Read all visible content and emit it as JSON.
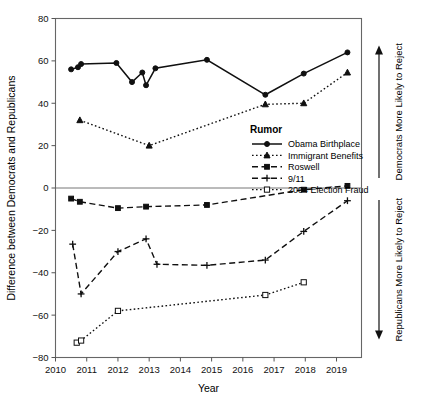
{
  "chart_data": {
    "type": "line",
    "title": "",
    "xlabel": "Year",
    "ylabel": "Difference between Democrats and Republicans",
    "xlim": [
      2010,
      2019.8
    ],
    "ylim": [
      -80,
      80
    ],
    "xticks": [
      2010,
      2011,
      2012,
      2013,
      2014,
      2015,
      2016,
      2017,
      2018,
      2019
    ],
    "yticks": [
      80,
      60,
      40,
      20,
      0,
      -20,
      -40,
      -60,
      -80
    ],
    "grid": false,
    "legend_title": "Rumor",
    "legend_position": "center-right-inside",
    "zero_reference_line": 0,
    "annotations": [
      {
        "name": "upper-arrow-label",
        "text": "Democrats More Likely to Reject",
        "direction": "up"
      },
      {
        "name": "lower-arrow-label",
        "text": "Republicans More Likely to Reject",
        "direction": "down"
      }
    ],
    "series": [
      {
        "name": "Obama Birthplace",
        "line_style": "solid",
        "marker": "circle-filled",
        "x": [
          2010.5,
          2010.72,
          2010.82,
          2011.95,
          2012.45,
          2012.78,
          2012.9,
          2013.2,
          2014.85,
          2016.72,
          2017.95,
          2019.35
        ],
        "values": [
          56,
          57,
          58.5,
          59,
          50,
          54.5,
          48.5,
          56.5,
          60.5,
          44,
          54,
          64
        ]
      },
      {
        "name": "Immigrant Benefits",
        "line_style": "dotted",
        "marker": "triangle-filled",
        "x": [
          2010.78,
          2013.0,
          2016.72,
          2017.95,
          2019.35
        ],
        "values": [
          32,
          20,
          39.5,
          40,
          54.5
        ]
      },
      {
        "name": "Roswell",
        "line_style": "dashed",
        "marker": "square-filled",
        "x": [
          2010.5,
          2010.78,
          2012.0,
          2012.9,
          2014.85,
          2017.95,
          2019.35
        ],
        "values": [
          -5,
          -6.5,
          -9.5,
          -8.8,
          -8,
          -0.8,
          1
        ]
      },
      {
        "name": "9/11",
        "line_style": "dashed",
        "marker": "plus",
        "x": [
          2010.55,
          2010.82,
          2012.0,
          2012.9,
          2013.25,
          2014.85,
          2016.72,
          2017.95,
          2019.35
        ],
        "values": [
          -26.5,
          -50,
          -30,
          -24,
          -36,
          -36.5,
          -34,
          -20.5,
          -6
        ]
      },
      {
        "name": "2004 Election Fraud",
        "line_style": "dotted",
        "marker": "square-open",
        "x": [
          2010.68,
          2010.82,
          2012.0,
          2016.72,
          2017.95
        ],
        "values": [
          -73,
          -72,
          -58,
          -50.5,
          -44.5
        ]
      }
    ]
  },
  "legend": {
    "title": "Rumor",
    "entries": [
      {
        "label": "Obama Birthplace"
      },
      {
        "label": "Immigrant Benefits"
      },
      {
        "label": "Roswell"
      },
      {
        "label": "9/11"
      },
      {
        "label": "2004 Election Fraud"
      }
    ]
  },
  "axes": {
    "x_title": "Year",
    "y_title": "Difference between Democrats and Republicans",
    "x_tick_labels": [
      "2010",
      "2011",
      "2012",
      "2013",
      "2014",
      "2015",
      "2016",
      "2017",
      "2018",
      "2019"
    ],
    "y_tick_labels": [
      "80",
      "60",
      "40",
      "20",
      "0",
      "−20",
      "−40",
      "−60",
      "−80"
    ]
  },
  "side_annotations": {
    "upper": "Democrats More Likely to Reject",
    "lower": "Republicans More Likely to Reject"
  },
  "colors": {
    "ink": "#101010",
    "frame": "#666666",
    "background": "#ffffff"
  }
}
